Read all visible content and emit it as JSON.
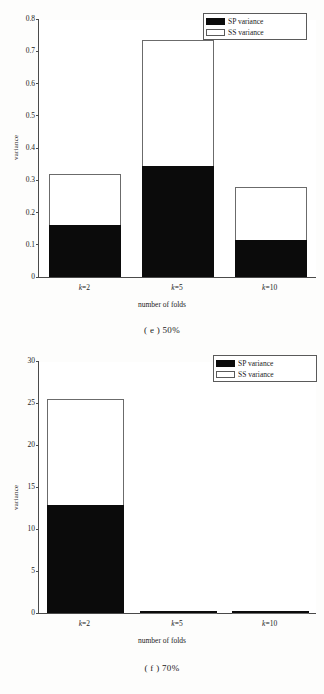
{
  "figures": [
    {
      "id": "e",
      "caption": "( e ) 50%",
      "legend": [
        {
          "label": "SP variance",
          "swatch": "black",
          "color": "#0b0b0b"
        },
        {
          "label": "SS variance",
          "swatch": "white",
          "color": "#ffffff"
        }
      ],
      "chart_data": {
        "type": "bar",
        "subtype": "stacked",
        "title": "( e ) 50%",
        "xlabel": "number of folds",
        "ylabel": "variance",
        "categories": [
          "k=2",
          "k=5",
          "k=10"
        ],
        "ylim": [
          0,
          0.8
        ],
        "yticks": [
          0,
          0.1,
          0.2,
          0.3,
          0.4,
          0.5,
          0.6,
          0.7,
          0.8
        ],
        "ytick_labels": [
          "0",
          "0.1",
          "0.2",
          "0.3",
          "0.4",
          "0.5",
          "0.6",
          "0.7",
          "0.8"
        ],
        "grid": false,
        "legend_position": "upper right",
        "series": [
          {
            "name": "SP variance",
            "color": "#0b0b0b",
            "values": [
              0.16,
              0.345,
              0.115
            ]
          },
          {
            "name": "SS variance",
            "color": "#ffffff",
            "values": [
              0.16,
              0.39,
              0.165
            ]
          }
        ],
        "totals": [
          0.32,
          0.735,
          0.28
        ]
      }
    },
    {
      "id": "f",
      "caption": "( f ) 70%",
      "legend": [
        {
          "label": "SP variance",
          "swatch": "black",
          "color": "#0b0b0b"
        },
        {
          "label": "SS variance",
          "swatch": "white",
          "color": "#ffffff"
        }
      ],
      "chart_data": {
        "type": "bar",
        "subtype": "stacked",
        "title": "( f ) 70%",
        "xlabel": "number of folds",
        "ylabel": "variance",
        "categories": [
          "k=2",
          "k=5",
          "k=10"
        ],
        "ylim": [
          0,
          30
        ],
        "yticks": [
          0,
          5,
          10,
          15,
          20,
          25,
          30
        ],
        "ytick_labels": [
          "0",
          "5",
          "10",
          "15",
          "20",
          "25",
          "30"
        ],
        "grid": false,
        "legend_position": "upper right",
        "series": [
          {
            "name": "SP variance",
            "color": "#0b0b0b",
            "values": [
              12.8,
              0.12,
              0.05
            ]
          },
          {
            "name": "SS variance",
            "color": "#ffffff",
            "values": [
              12.7,
              0.0,
              0.0
            ]
          }
        ],
        "totals": [
          25.5,
          0.12,
          0.05
        ]
      }
    }
  ]
}
